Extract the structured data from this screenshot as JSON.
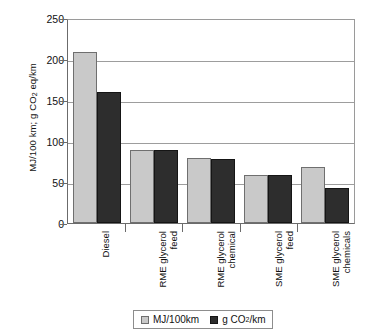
{
  "chart_data": {
    "type": "bar",
    "title": "",
    "xlabel": "",
    "ylabel": "MJ/100 km; g CO2 eq/km",
    "ylim": [
      0,
      250
    ],
    "yticks": [
      0,
      50,
      100,
      150,
      200,
      250
    ],
    "grid": true,
    "legend_position": "bottom",
    "categories": [
      "Diesel",
      "RME glycerol\nfeed",
      "RME glycerol\nchemical",
      "SME glycerol\nfeed",
      "SME glycerol\nchemicals"
    ],
    "series": [
      {
        "name": "MJ/100km",
        "color": "#c9c9c9",
        "values": [
          209,
          89,
          79,
          58,
          68
        ]
      },
      {
        "name": "g CO2/km",
        "color": "#2d2d2d",
        "values": [
          160,
          89,
          78,
          58,
          43
        ]
      }
    ]
  },
  "axis": {
    "y_title_prefix": "MJ/100 km; g CO",
    "y_title_sub": "2",
    "y_title_suffix": " eq/km",
    "tick_labels": [
      "250",
      "200",
      "150",
      "100",
      "50",
      "0"
    ]
  },
  "legend": {
    "items": [
      {
        "label": "MJ/100km",
        "sub": "",
        "suffix": ""
      },
      {
        "label": "g CO",
        "sub": "2",
        "suffix": "/km"
      }
    ]
  }
}
